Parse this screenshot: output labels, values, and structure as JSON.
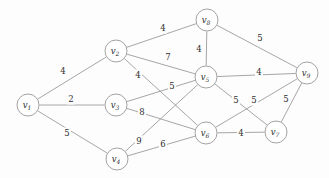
{
  "figure": {
    "title": "",
    "type": "weighted-undirected-graph",
    "background_color": "#fdfdfd",
    "edge_color": "#8f8f8f",
    "node_fill": "#ffffff",
    "node_stroke": "#8a8a8a",
    "text_color": "#2f2f2f"
  },
  "chart_data": {
    "type": "diagram",
    "subtype": "weighted-undirected-graph",
    "title": "",
    "xlabel": "",
    "ylabel": "",
    "node_count": 9,
    "edge_count": 16,
    "nodes": [
      {
        "id": "v1",
        "letter": "v",
        "sub": "1",
        "x": 28,
        "y": 105,
        "r": 11
      },
      {
        "id": "v2",
        "letter": "v",
        "sub": "2",
        "x": 116,
        "y": 51,
        "r": 11
      },
      {
        "id": "v3",
        "letter": "v",
        "sub": "3",
        "x": 116,
        "y": 105,
        "r": 11
      },
      {
        "id": "v4",
        "letter": "v",
        "sub": "4",
        "x": 117,
        "y": 159,
        "r": 11
      },
      {
        "id": "v5",
        "letter": "v",
        "sub": "5",
        "x": 206,
        "y": 77,
        "r": 11
      },
      {
        "id": "v6",
        "letter": "v",
        "sub": "6",
        "x": 206,
        "y": 133,
        "r": 11
      },
      {
        "id": "v7",
        "letter": "v",
        "sub": "7",
        "x": 276,
        "y": 132,
        "r": 11
      },
      {
        "id": "v8",
        "letter": "v",
        "sub": "8",
        "x": 207,
        "y": 20,
        "r": 11
      },
      {
        "id": "v9",
        "letter": "v",
        "sub": "9",
        "x": 307,
        "y": 73,
        "r": 11
      }
    ],
    "edges": [
      {
        "from": "v1",
        "to": "v2",
        "weight": "4",
        "lx": 63,
        "ly": 71
      },
      {
        "from": "v1",
        "to": "v3",
        "weight": "2",
        "lx": 71,
        "ly": 99
      },
      {
        "from": "v1",
        "to": "v4",
        "weight": "5",
        "lx": 67,
        "ly": 133
      },
      {
        "from": "v2",
        "to": "v8",
        "weight": "4",
        "lx": 163,
        "ly": 28
      },
      {
        "from": "v2",
        "to": "v5",
        "weight": "7",
        "lx": 168,
        "ly": 57
      },
      {
        "from": "v2",
        "to": "v6",
        "weight": "4",
        "lx": 138,
        "ly": 75
      },
      {
        "from": "v3",
        "to": "v5",
        "weight": "5",
        "lx": 172,
        "ly": 86
      },
      {
        "from": "v3",
        "to": "v6",
        "weight": "8",
        "lx": 142,
        "ly": 112
      },
      {
        "from": "v4",
        "to": "v5",
        "weight": "9",
        "lx": 139,
        "ly": 141
      },
      {
        "from": "v4",
        "to": "v6",
        "weight": "6",
        "lx": 163,
        "ly": 144
      },
      {
        "from": "v8",
        "to": "v5",
        "weight": "4",
        "lx": 199,
        "ly": 49
      },
      {
        "from": "v8",
        "to": "v9",
        "weight": "5",
        "lx": 260,
        "ly": 38
      },
      {
        "from": "v5",
        "to": "v9",
        "weight": "4",
        "lx": 259,
        "ly": 72
      },
      {
        "from": "v5",
        "to": "v7",
        "weight": "5",
        "lx": 236,
        "ly": 100
      },
      {
        "from": "v6",
        "to": "v9",
        "weight": "5",
        "lx": 254,
        "ly": 100
      },
      {
        "from": "v6",
        "to": "v7",
        "weight": "4",
        "lx": 241,
        "ly": 133
      },
      {
        "from": "v7",
        "to": "v9",
        "weight": "5",
        "lx": 286,
        "ly": 99
      }
    ]
  }
}
